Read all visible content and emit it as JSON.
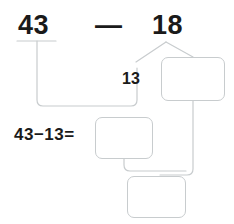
{
  "problem": {
    "minuend": "43",
    "operator": "—",
    "subtrahend": "18",
    "part_left": "13",
    "equation_label": "43−13=",
    "boxes": [
      {
        "name": "part-right",
        "value": ""
      },
      {
        "name": "middle-answer",
        "value": ""
      },
      {
        "name": "bottom-answer",
        "value": ""
      }
    ]
  },
  "colors": {
    "text": "#1a1a1a",
    "wire": "#c8ccce",
    "box_border": "#c8ccce",
    "background": "#ffffff"
  },
  "connectors": {
    "minuend_underline": "horizontal rule under 43",
    "bracket_43_to_13": "43 down, across, up to 13",
    "split_under_18": "inverted V branching 18 into 13 and empty box",
    "part_right_to_bottom": "right box down to bottom row",
    "middle_to_bottom": "middle box down and right"
  }
}
